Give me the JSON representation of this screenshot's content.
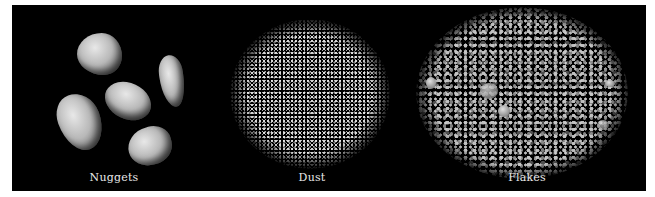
{
  "figure": {
    "panels": [
      {
        "id": "nuggets",
        "label": "Nuggets",
        "subject": "five rounded gold nuggets on black background"
      },
      {
        "id": "dust",
        "label": "Dust",
        "subject": "circular pile of fine gold dust on black background"
      },
      {
        "id": "flakes",
        "label": "Flakes",
        "subject": "oval pile of coarse gold flakes on black background"
      }
    ],
    "colors": {
      "background": "#000000",
      "page": "#ffffff",
      "label": "#e8e8e8"
    }
  }
}
